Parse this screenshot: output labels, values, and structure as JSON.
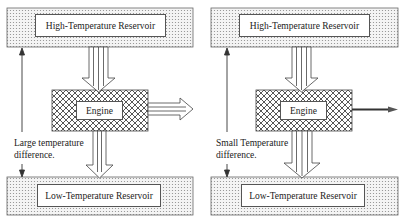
{
  "panels": [
    {
      "id": "left",
      "hot_reservoir": "High-Temperature Reservoir",
      "cold_reservoir": "Low-Temperature Reservoir",
      "engine": "Engine",
      "note_line1": "Large temperature",
      "note_line2": "difference.",
      "work_output": "large"
    },
    {
      "id": "right",
      "hot_reservoir": "High-Temperature Reservoir",
      "cold_reservoir": "Low-Temperature Reservoir",
      "engine": "Engine",
      "note_line1": "Small Temperature",
      "note_line2": "difference.",
      "work_output": "small"
    }
  ],
  "colors": {
    "outline": "#555555",
    "dot_pattern": "#9a9a9a",
    "hatch_pattern": "#444444",
    "arrow_stroke": "#444444"
  }
}
